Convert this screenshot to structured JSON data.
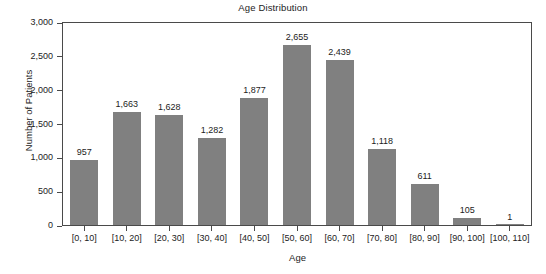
{
  "chart_data": {
    "type": "bar",
    "title": "Age Distribution",
    "xlabel": "Age",
    "ylabel": "Number of Patients",
    "categories": [
      "[0, 10]",
      "[10, 20]",
      "[20, 30]",
      "[30, 40]",
      "[40, 50]",
      "[50, 60]",
      "[60, 70]",
      "[70, 80]",
      "[80, 90]",
      "[90, 100]",
      "[100, 110]"
    ],
    "values": [
      957,
      1663,
      1628,
      1282,
      1877,
      2655,
      2439,
      1118,
      611,
      105,
      1
    ],
    "value_labels": [
      "957",
      "1,663",
      "1,628",
      "1,282",
      "1,877",
      "2,655",
      "2,439",
      "1,118",
      "611",
      "105",
      "1"
    ],
    "ylim": [
      0,
      3000
    ],
    "yticks": [
      0,
      500,
      1000,
      1500,
      2000,
      2500,
      3000
    ],
    "ytick_labels": [
      "0",
      "500",
      "1,000",
      "1,500",
      "2,000",
      "2,500",
      "3,000"
    ],
    "grid": false,
    "legend": false,
    "bar_color": "#808080",
    "axis_color": "#4a4a4a",
    "background_color": "#ffffff"
  }
}
